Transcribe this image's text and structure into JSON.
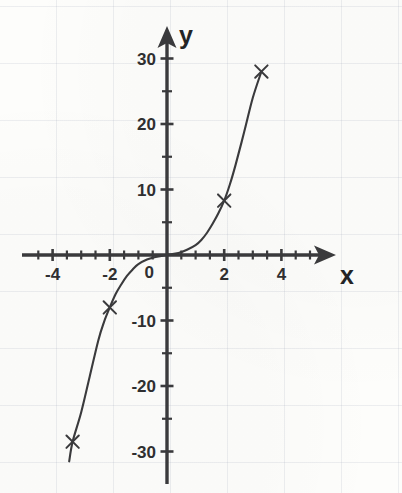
{
  "figure": {
    "kind": "hand-drawn-graph",
    "paper_color": "#fdfdfb",
    "ink_color": "#3a3a3c",
    "grid_color": "#96a0af"
  },
  "axes": {
    "x_axis_label": "x",
    "y_axis_label": "y",
    "origin_label": "0"
  },
  "chart_data": {
    "type": "line",
    "title": "",
    "subtitle": "",
    "xlabel": "x",
    "ylabel": "y",
    "xlim": [
      -4.8,
      5.6
    ],
    "ylim": [
      -33,
      33
    ],
    "grid": true,
    "grid_style": "faint graph paper squares",
    "legend": null,
    "legend_position": "none",
    "x_ticks_major": [
      -4,
      -2,
      0,
      2,
      4
    ],
    "x_tick_labels": [
      "-4",
      "-2",
      "0",
      "2",
      "4"
    ],
    "x_tick_minor_step": 0.5,
    "y_ticks_major": [
      30,
      20,
      10,
      -10,
      -20,
      -30
    ],
    "y_tick_labels": [
      "30",
      "20",
      "10",
      "-10",
      "-20",
      "-30"
    ],
    "y_tick_minor_step": 5,
    "x_axis_arrow": true,
    "y_axis_arrow": true,
    "series": [
      {
        "name": "y = x^3",
        "style": "curve",
        "marker": "x-cross",
        "x": [
          -3.3,
          -2.0,
          2.0,
          3.3
        ],
        "values": [
          -28.5,
          -8.0,
          8.3,
          28.0
        ],
        "marked_points": [
          {
            "x": -3.3,
            "y": -28.5
          },
          {
            "x": -2.0,
            "y": -8.0
          },
          {
            "x": 2.0,
            "y": 8.3
          },
          {
            "x": 3.3,
            "y": 28.0
          }
        ],
        "curve_points": [
          {
            "x": -3.42,
            "y": -31.5
          },
          {
            "x": -3.3,
            "y": -28.5
          },
          {
            "x": -3.0,
            "y": -24.0
          },
          {
            "x": -2.7,
            "y": -18.5
          },
          {
            "x": -2.4,
            "y": -13.0
          },
          {
            "x": -2.2,
            "y": -10.2
          },
          {
            "x": -2.0,
            "y": -8.0
          },
          {
            "x": -1.8,
            "y": -6.0
          },
          {
            "x": -1.6,
            "y": -4.5
          },
          {
            "x": -1.4,
            "y": -3.2
          },
          {
            "x": -1.2,
            "y": -2.2
          },
          {
            "x": -1.0,
            "y": -1.4
          },
          {
            "x": -0.7,
            "y": -0.7
          },
          {
            "x": -0.4,
            "y": -0.3
          },
          {
            "x": 0.0,
            "y": 0.0
          },
          {
            "x": 0.4,
            "y": 0.3
          },
          {
            "x": 0.7,
            "y": 0.8
          },
          {
            "x": 1.0,
            "y": 1.5
          },
          {
            "x": 1.2,
            "y": 2.3
          },
          {
            "x": 1.4,
            "y": 3.4
          },
          {
            "x": 1.6,
            "y": 4.8
          },
          {
            "x": 1.8,
            "y": 6.4
          },
          {
            "x": 2.0,
            "y": 8.3
          },
          {
            "x": 2.2,
            "y": 10.8
          },
          {
            "x": 2.4,
            "y": 13.8
          },
          {
            "x": 2.7,
            "y": 18.8
          },
          {
            "x": 3.0,
            "y": 24.0
          },
          {
            "x": 3.3,
            "y": 28.0
          }
        ]
      }
    ]
  },
  "geometry": {
    "origin_px": {
      "x": 167,
      "y": 255
    },
    "px_per_unit_x": 28.6,
    "px_per_unit_y": 6.55,
    "x_axis_start_px": 22,
    "x_axis_end_px": 336,
    "y_axis_top_px": 26,
    "y_axis_bottom_px": 484
  }
}
